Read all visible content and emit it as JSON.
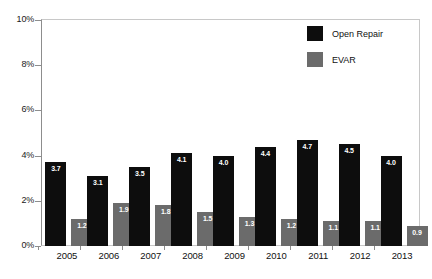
{
  "chart_data": {
    "type": "bar",
    "title": "",
    "xlabel": "",
    "ylabel": "",
    "categories": [
      "2005",
      "2006",
      "2007",
      "2008",
      "2009",
      "2010",
      "2011",
      "2012",
      "2013"
    ],
    "series": [
      {
        "name": "Open Repair",
        "color": "#0d0d0d",
        "values": [
          3.7,
          3.1,
          3.5,
          4.1,
          4.0,
          4.4,
          4.7,
          4.5,
          4.0
        ],
        "labels": [
          "3.7",
          "3.1",
          "3.5",
          "4.1",
          "4.0",
          "4.4",
          "4.7",
          "4.5",
          "4.0"
        ]
      },
      {
        "name": "EVAR",
        "color": "#6b6b6b",
        "values": [
          1.2,
          1.9,
          1.8,
          1.5,
          1.3,
          1.2,
          1.1,
          1.1,
          0.9
        ],
        "labels": [
          "1.2",
          "1.9",
          "1.8",
          "1.5",
          "1.3",
          "1.2",
          "1.1",
          "1.1",
          "0.9"
        ]
      }
    ],
    "ylim": [
      0,
      10
    ],
    "yticks": [
      0,
      2,
      4,
      6,
      8,
      10
    ],
    "ytick_labels": [
      "0%",
      "2%",
      "4%",
      "6%",
      "8%",
      "10%"
    ],
    "grid": false,
    "legend_position": "top-right",
    "value_labels_inside_bars": true
  },
  "legend": {
    "entries": [
      {
        "label": "Open Repair"
      },
      {
        "label": "EVAR"
      }
    ]
  },
  "colors": {
    "open_repair": "#0d0d0d",
    "evar": "#6b6b6b",
    "frame": "#c8c8c8",
    "axis": "#8d8d8d",
    "background": "#ffffff",
    "value_label_text": "#ffffff"
  }
}
